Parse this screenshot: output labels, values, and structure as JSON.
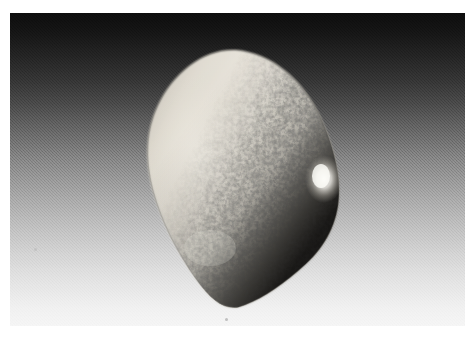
{
  "image": {
    "kind": "photograph",
    "title": "Speckled ovoid object on gradient backdrop",
    "width": 474,
    "height": 339,
    "page_background": "#ffffff",
    "margins": {
      "top": 13,
      "left": 10,
      "right": 9,
      "bottom": 13
    }
  },
  "photo": {
    "frame": {
      "x": 10,
      "y": 13,
      "width": 455,
      "height": 313
    },
    "backdrop": {
      "name": "studio-gradient-backdrop",
      "type": "vertical-linear-gradient",
      "direction": "top-to-bottom",
      "top_color": "#0d0d0d",
      "upper_mid_color": "#474747",
      "mid_color": "#949494",
      "lower_mid_color": "#c4c4c4",
      "bottom_color": "#f5f5f5",
      "grain": "fine-dither-noise"
    },
    "subject": {
      "name": "speckled-ovoid-object",
      "description": "rounded egg-like stone, smooth cream left half, dense dark mottled speckling on right half",
      "bounds": {
        "x": 138,
        "y": 48,
        "width": 190,
        "height": 258
      },
      "base_color": "#ded9cf",
      "shadow_color": "#8d8b86",
      "speckle_color": "#4a4845",
      "highlight_color": "#fbfaf6",
      "rim_color": "#3a3936",
      "highlight_spot": {
        "x": 313,
        "y": 166,
        "rx": 16,
        "ry": 21
      }
    },
    "artifacts": [
      {
        "name": "dust-speck-lower",
        "x": 225,
        "y": 318
      },
      {
        "name": "dust-speck-left",
        "x": 34,
        "y": 248
      }
    ]
  }
}
